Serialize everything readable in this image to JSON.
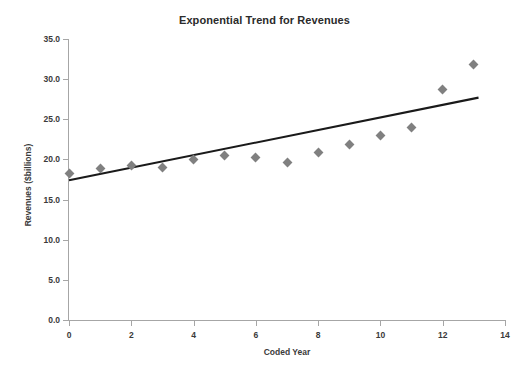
{
  "chart_data": {
    "type": "scatter",
    "title": "Exponential Trend for Revenues",
    "xlabel": "Coded Year",
    "ylabel": "Revenues ($billions)",
    "xlim": [
      0,
      14
    ],
    "ylim": [
      0,
      35
    ],
    "grid": false,
    "legend": "none",
    "x_ticks": [
      "0",
      "2",
      "4",
      "6",
      "8",
      "10",
      "12",
      "14"
    ],
    "x_tick_values": [
      0,
      2,
      4,
      6,
      8,
      10,
      12,
      14
    ],
    "y_ticks": [
      "0.0",
      "5.0",
      "10.0",
      "15.0",
      "20.0",
      "25.0",
      "30.0",
      "35.0"
    ],
    "y_tick_values": [
      0,
      5,
      10,
      15,
      20,
      25,
      30,
      35
    ],
    "marker": {
      "shape": "diamond",
      "color": "#808080",
      "size": 7
    },
    "x": [
      0,
      1,
      2,
      3,
      4,
      5,
      6,
      7,
      8,
      9,
      10,
      11,
      12,
      13
    ],
    "values": [
      18.3,
      18.9,
      19.3,
      19.0,
      20.0,
      20.5,
      20.2,
      19.6,
      20.9,
      21.9,
      23.0,
      24.0,
      28.7,
      31.8
    ],
    "series": [
      {
        "name": "Revenues",
        "type": "scatter",
        "color": "#808080",
        "values": [
          18.3,
          18.9,
          19.3,
          19.0,
          20.0,
          20.5,
          20.2,
          19.6,
          20.9,
          21.9,
          23.0,
          24.0,
          28.7,
          31.8
        ]
      },
      {
        "name": "Exponential trend",
        "type": "line",
        "color": "#1a1a1a",
        "endpoints": [
          {
            "x": 0,
            "y": 17.4
          },
          {
            "x": 13.15,
            "y": 27.7
          }
        ]
      }
    ],
    "annotations": []
  },
  "colors": {
    "marker": "#808080",
    "trend_line": "#1a1a1a",
    "axis": "#a6a6a6",
    "text": "#3a3a3a",
    "title": "#2b2b2b",
    "background": "#ffffff"
  }
}
